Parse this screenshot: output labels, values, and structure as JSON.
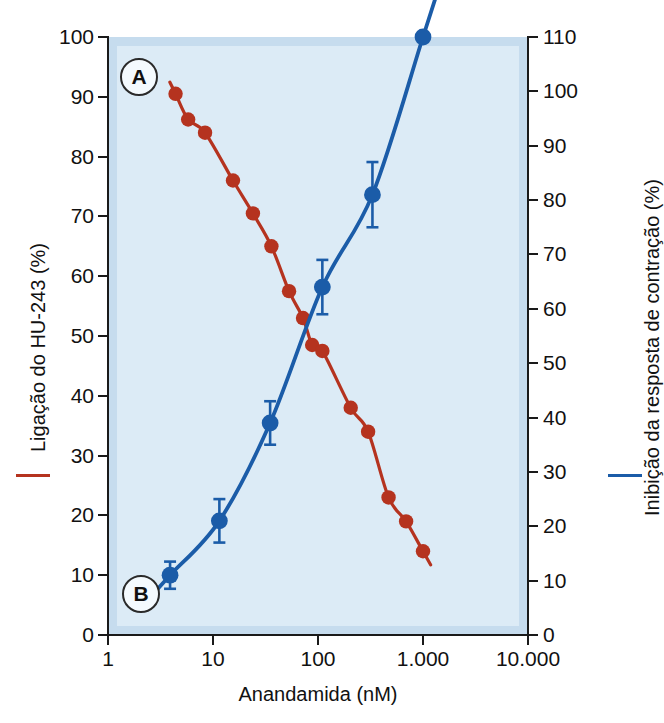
{
  "figure": {
    "panels": [
      {
        "id": "A",
        "label": "A",
        "series": "binding"
      },
      {
        "id": "B",
        "label": "B",
        "series": "inhibition"
      }
    ],
    "colors": {
      "red": "#b5331f",
      "blue": "#1b5ca8",
      "plot_background": "#dcebf6",
      "plot_border": "#c6dcee",
      "axis": "#1a1a1a",
      "page_background": "#ffffff"
    }
  },
  "chart_data": {
    "type": "scatter",
    "title": "",
    "xlabel": "Anandamida (nM)",
    "xscale": "log",
    "xlim": [
      1,
      10000
    ],
    "xticks": [
      1,
      10,
      100,
      1000,
      10000
    ],
    "xticklabels": [
      "1",
      "10",
      "100",
      "1.000",
      "10.000"
    ],
    "grid": false,
    "legend_position": "axis-titles",
    "axes": [
      {
        "id": "left",
        "label": "Ligação do HU-243 (%)",
        "color": "#b5331f",
        "lim": [
          0,
          100
        ],
        "ticks": [
          0,
          10,
          20,
          30,
          40,
          50,
          60,
          70,
          80,
          90,
          100
        ],
        "ticklabels": [
          "0",
          "10",
          "20",
          "30",
          "40",
          "50",
          "60",
          "70",
          "80",
          "90",
          "100"
        ]
      },
      {
        "id": "right",
        "label": "Inibição da resposta de contração (%)",
        "color": "#1b5ca8",
        "lim": [
          0,
          110
        ],
        "ticks": [
          0,
          10,
          20,
          30,
          40,
          50,
          60,
          70,
          80,
          90,
          100,
          110
        ],
        "ticklabels": [
          "0",
          "10",
          "20",
          "30",
          "40",
          "50",
          "60",
          "70",
          "80",
          "90",
          "100",
          "110"
        ]
      }
    ],
    "series": [
      {
        "name": "Ligação do HU-243 (%)",
        "panel": "A",
        "axis": "left",
        "color": "#b5331f",
        "marker": "circle",
        "x": [
          4.4,
          5.8,
          8.4,
          15.5,
          24,
          36,
          53,
          72,
          88,
          110,
          205,
          300,
          470,
          690,
          1000
        ],
        "y": [
          90.5,
          86.2,
          84,
          76,
          70.5,
          65,
          57.5,
          53,
          48.5,
          47.5,
          38,
          34,
          23,
          19,
          14
        ],
        "errors": null
      },
      {
        "name": "Inibição da resposta de contração (%)",
        "panel": "B",
        "axis": "right",
        "color": "#1b5ca8",
        "marker": "circle",
        "x": [
          3.9,
          11.5,
          35,
          110,
          330,
          1000
        ],
        "y": [
          11,
          21,
          39,
          64,
          81,
          110
        ],
        "errors": [
          2.5,
          4,
          4,
          5,
          6,
          0
        ]
      }
    ]
  }
}
